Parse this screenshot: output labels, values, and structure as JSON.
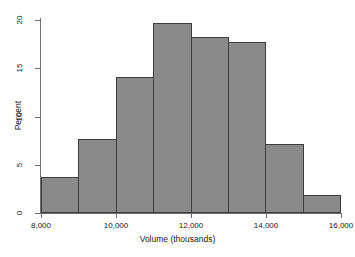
{
  "chart_data": {
    "type": "bar",
    "title": "",
    "subtitle": "",
    "xlabel": "Volume (thousands)",
    "ylabel": "Percent",
    "categories": [
      "8,000-9,000",
      "9,000-10,000",
      "10,000-11,000",
      "11,000-12,000",
      "12,000-13,000",
      "13,000-14,000",
      "14,000-15,000",
      "15,000-16,000"
    ],
    "bin_edges": [
      8000,
      9000,
      10000,
      11000,
      12000,
      13000,
      14000,
      15000,
      16000
    ],
    "values": [
      3.7,
      7.7,
      14.1,
      19.7,
      18.2,
      17.7,
      7.2,
      1.9
    ],
    "xlim": [
      8000,
      16000
    ],
    "ylim": [
      0,
      20
    ],
    "x_ticks": [
      8000,
      10000,
      12000,
      14000,
      16000
    ],
    "x_tick_labels": [
      "8,000",
      "10,000",
      "12,000",
      "14,000",
      "16,000"
    ],
    "y_ticks": [
      0,
      5,
      10,
      15,
      20
    ],
    "y_tick_labels": [
      "0",
      "5",
      "10",
      "15",
      "20"
    ],
    "grid": false,
    "legend": false,
    "bar_color": "#8a8a8a",
    "bar_edge_color": "#3d3d3d",
    "axis_color": "#6e6e6e",
    "background_color": "#ffffff"
  }
}
